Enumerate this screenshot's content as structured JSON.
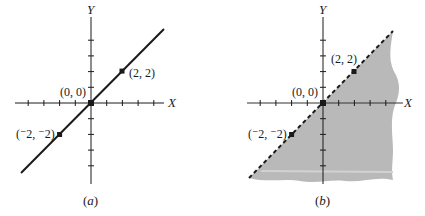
{
  "panels": [
    {
      "id": "a",
      "caption_open": "(",
      "caption_letter": "a",
      "caption_close": ")",
      "x_axis_label": "X",
      "y_axis_label": "Y",
      "line_style": "solid",
      "shaded": false,
      "points": [
        {
          "label": "(0, 0)",
          "x": 0,
          "y": 0
        },
        {
          "label": "(2, 2)",
          "x": 2,
          "y": 2
        },
        {
          "label": "(⁻2, ⁻2)",
          "x": -2,
          "y": -2
        }
      ]
    },
    {
      "id": "b",
      "caption_open": "(",
      "caption_letter": "b",
      "caption_close": ")",
      "x_axis_label": "X",
      "y_axis_label": "Y",
      "line_style": "dashed",
      "shaded": true,
      "shade_color": "#b9b9b9",
      "points": [
        {
          "label": "(0, 0)",
          "x": 0,
          "y": 0
        },
        {
          "label": "(2, 2)",
          "x": 2,
          "y": 2
        },
        {
          "label": "(⁻2, ⁻2)",
          "x": -2,
          "y": -2
        }
      ]
    }
  ],
  "colors": {
    "ink": "#1a1a1a",
    "shade": "#b9b9b9",
    "shade_highlight": "#d2d2d2"
  }
}
